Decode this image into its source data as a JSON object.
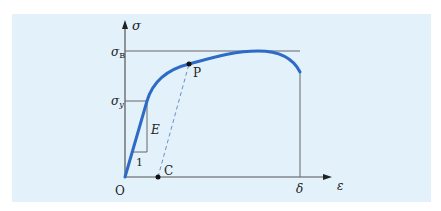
{
  "diagram": {
    "type": "stress-strain-curve",
    "colors": {
      "background": "#e3f1fb",
      "curve": "#2e6bc6",
      "axes": "#555555",
      "guides": "#666666",
      "text": "#222222"
    },
    "axes": {
      "y_label": "σ",
      "x_label": "ε",
      "origin_label": "O"
    },
    "labels": {
      "sigma_B": "σ",
      "sigma_B_sub": "B",
      "sigma_y": "σ",
      "sigma_y_sub": "y",
      "modulus": "E",
      "unit_run": "1",
      "point_P": "P",
      "point_C": "C",
      "delta": "δ"
    }
  }
}
